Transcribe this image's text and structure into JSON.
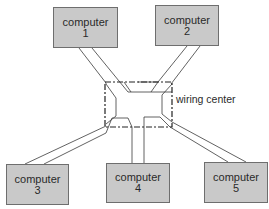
{
  "diagram": {
    "type": "star network",
    "hub": {
      "label": "wiring center"
    },
    "nodes": [
      {
        "id": "computer-1",
        "label": "computer",
        "number": "1"
      },
      {
        "id": "computer-2",
        "label": "computer",
        "number": "2"
      },
      {
        "id": "computer-3",
        "label": "computer",
        "number": "3"
      },
      {
        "id": "computer-4",
        "label": "computer",
        "number": "4"
      },
      {
        "id": "computer-5",
        "label": "computer",
        "number": "5"
      }
    ],
    "edges": [
      {
        "from": "computer-1",
        "to": "wiring center"
      },
      {
        "from": "computer-2",
        "to": "wiring center"
      },
      {
        "from": "computer-3",
        "to": "wiring center"
      },
      {
        "from": "computer-4",
        "to": "wiring center"
      },
      {
        "from": "computer-5",
        "to": "wiring center"
      }
    ]
  },
  "colors": {
    "box_fill": "#c9c9c9",
    "box_border": "#6e6e6e",
    "line": "#3a3a3a"
  }
}
